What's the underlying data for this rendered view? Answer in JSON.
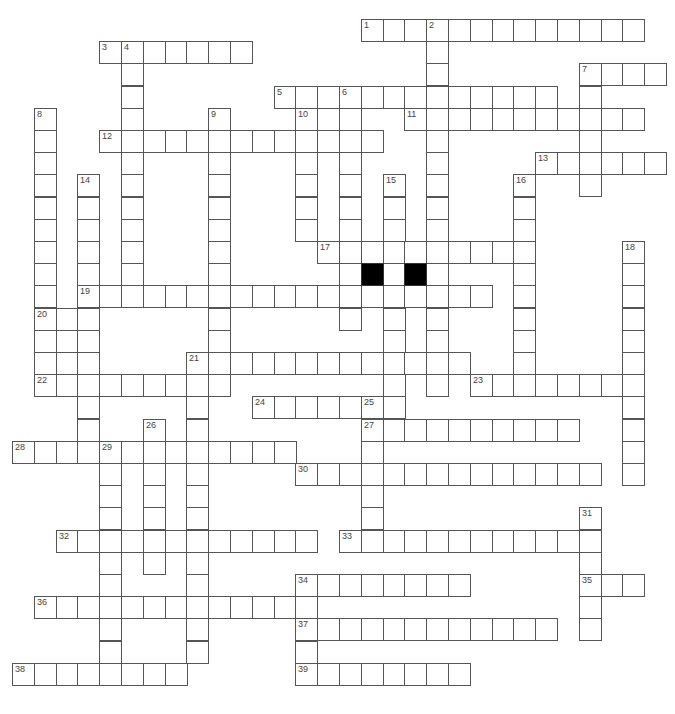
{
  "puzzle": {
    "title": "",
    "grid": {
      "origin_x": 12,
      "origin_y": 19,
      "col_pitch": 21.8,
      "row_pitch": 22.2,
      "cell_color": "#ffffff",
      "border_color": "#555555",
      "block_color": "#000000"
    },
    "numbers": [
      {
        "n": "1",
        "r": 0,
        "c": 16
      },
      {
        "n": "2",
        "r": 0,
        "c": 19
      },
      {
        "n": "3",
        "r": 1,
        "c": 4
      },
      {
        "n": "4",
        "r": 1,
        "c": 5
      },
      {
        "n": "5",
        "r": 3,
        "c": 12
      },
      {
        "n": "6",
        "r": 3,
        "c": 15
      },
      {
        "n": "7",
        "r": 2,
        "c": 26
      },
      {
        "n": "8",
        "r": 4,
        "c": 1
      },
      {
        "n": "9",
        "r": 4,
        "c": 9
      },
      {
        "n": "10",
        "r": 4,
        "c": 13
      },
      {
        "n": "11",
        "r": 4,
        "c": 18
      },
      {
        "n": "12",
        "r": 5,
        "c": 4
      },
      {
        "n": "13",
        "r": 6,
        "c": 24
      },
      {
        "n": "14",
        "r": 7,
        "c": 3
      },
      {
        "n": "15",
        "r": 7,
        "c": 17
      },
      {
        "n": "16",
        "r": 7,
        "c": 23
      },
      {
        "n": "17",
        "r": 10,
        "c": 14
      },
      {
        "n": "18",
        "r": 10,
        "c": 28
      },
      {
        "n": "19",
        "r": 12,
        "c": 3
      },
      {
        "n": "20",
        "r": 13,
        "c": 1
      },
      {
        "n": "21",
        "r": 15,
        "c": 8
      },
      {
        "n": "22",
        "r": 16,
        "c": 1
      },
      {
        "n": "23",
        "r": 16,
        "c": 21
      },
      {
        "n": "24",
        "r": 17,
        "c": 11
      },
      {
        "n": "25",
        "r": 17,
        "c": 16
      },
      {
        "n": "26",
        "r": 18,
        "c": 6
      },
      {
        "n": "27",
        "r": 18,
        "c": 16
      },
      {
        "n": "28",
        "r": 19,
        "c": 0
      },
      {
        "n": "29",
        "r": 19,
        "c": 4
      },
      {
        "n": "30",
        "r": 20,
        "c": 13
      },
      {
        "n": "31",
        "r": 22,
        "c": 26
      },
      {
        "n": "32",
        "r": 23,
        "c": 2
      },
      {
        "n": "33",
        "r": 23,
        "c": 15
      },
      {
        "n": "34",
        "r": 25,
        "c": 13
      },
      {
        "n": "35",
        "r": 25,
        "c": 26
      },
      {
        "n": "36",
        "r": 26,
        "c": 1
      },
      {
        "n": "37",
        "r": 27,
        "c": 13
      },
      {
        "n": "38",
        "r": 29,
        "c": 0
      },
      {
        "n": "39",
        "r": 29,
        "c": 13
      }
    ],
    "across": [
      {
        "r": 0,
        "c": 16,
        "len": 13
      },
      {
        "r": 1,
        "c": 4,
        "len": 7
      },
      {
        "r": 2,
        "c": 26,
        "len": 4
      },
      {
        "r": 3,
        "c": 12,
        "len": 13
      },
      {
        "r": 4,
        "c": 18,
        "len": 11
      },
      {
        "r": 5,
        "c": 4,
        "len": 13
      },
      {
        "r": 6,
        "c": 24,
        "len": 6
      },
      {
        "r": 10,
        "c": 14,
        "len": 10
      },
      {
        "r": 12,
        "c": 3,
        "len": 19
      },
      {
        "r": 13,
        "c": 1,
        "len": 3
      },
      {
        "r": 14,
        "c": 1,
        "len": 3
      },
      {
        "r": 15,
        "c": 1,
        "len": 3
      },
      {
        "r": 15,
        "c": 8,
        "len": 13
      },
      {
        "r": 16,
        "c": 1,
        "len": 9
      },
      {
        "r": 16,
        "c": 21,
        "len": 8
      },
      {
        "r": 17,
        "c": 11,
        "len": 7
      },
      {
        "r": 18,
        "c": 16,
        "len": 10
      },
      {
        "r": 19,
        "c": 0,
        "len": 13
      },
      {
        "r": 20,
        "c": 13,
        "len": 14
      },
      {
        "r": 23,
        "c": 2,
        "len": 12
      },
      {
        "r": 23,
        "c": 15,
        "len": 12
      },
      {
        "r": 25,
        "c": 13,
        "len": 8
      },
      {
        "r": 25,
        "c": 26,
        "len": 3
      },
      {
        "r": 26,
        "c": 1,
        "len": 13
      },
      {
        "r": 27,
        "c": 13,
        "len": 12
      },
      {
        "r": 29,
        "c": 0,
        "len": 8
      },
      {
        "r": 29,
        "c": 13,
        "len": 8
      }
    ],
    "down": [
      {
        "r": 0,
        "c": 19,
        "len": 17
      },
      {
        "r": 1,
        "c": 5,
        "len": 12
      },
      {
        "r": 2,
        "c": 26,
        "len": 6
      },
      {
        "r": 3,
        "c": 15,
        "len": 11
      },
      {
        "r": 4,
        "c": 1,
        "len": 13
      },
      {
        "r": 4,
        "c": 9,
        "len": 13
      },
      {
        "r": 4,
        "c": 13,
        "len": 6
      },
      {
        "r": 7,
        "c": 3,
        "len": 13
      },
      {
        "r": 7,
        "c": 17,
        "len": 11
      },
      {
        "r": 7,
        "c": 23,
        "len": 10
      },
      {
        "r": 10,
        "c": 28,
        "len": 11
      },
      {
        "r": 15,
        "c": 8,
        "len": 14
      },
      {
        "r": 17,
        "c": 16,
        "len": 7
      },
      {
        "r": 18,
        "c": 6,
        "len": 7
      },
      {
        "r": 19,
        "c": 4,
        "len": 10
      },
      {
        "r": 22,
        "c": 26,
        "len": 6
      },
      {
        "r": 25,
        "c": 13,
        "len": 5
      }
    ],
    "blocks": [
      {
        "r": 11,
        "c": 16
      },
      {
        "r": 11,
        "c": 18
      }
    ]
  }
}
